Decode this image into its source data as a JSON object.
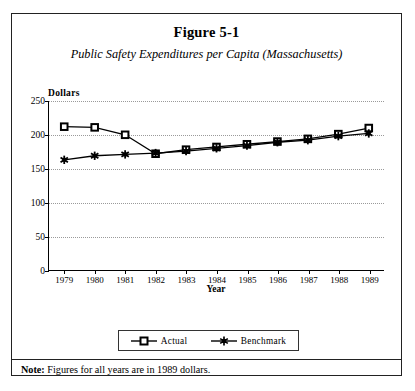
{
  "figure": {
    "title": "Figure 5-1",
    "subtitle": "Public Safety Expenditures per Capita (Massachusetts)",
    "note_label": "Note:",
    "note_text": " Figures for all years are in 1989 dollars."
  },
  "legend": {
    "items": [
      {
        "label": "Actual",
        "marker": "open-square",
        "color": "#000000"
      },
      {
        "label": "Benchmark",
        "marker": "filled-star",
        "color": "#000000"
      }
    ]
  },
  "chart_data": {
    "type": "line",
    "title": "Public Safety Expenditures per Capita (Massachusetts)",
    "xlabel": "Year",
    "ylabel": "Dollars",
    "categories": [
      "1979",
      "1980",
      "1981",
      "1982",
      "1983",
      "1984",
      "1985",
      "1986",
      "1987",
      "1988",
      "1989"
    ],
    "yticks": [
      0,
      50,
      100,
      150,
      200,
      250
    ],
    "ylim": [
      0,
      250
    ],
    "grid": true,
    "legend_position": "bottom-center",
    "series": [
      {
        "name": "Actual",
        "marker": "open-square",
        "values": [
          212,
          211,
          200,
          172,
          178,
          182,
          186,
          190,
          194,
          201,
          210
        ]
      },
      {
        "name": "Benchmark",
        "marker": "filled-star",
        "values": [
          163,
          169,
          171,
          173,
          176,
          180,
          184,
          189,
          192,
          198,
          202
        ]
      }
    ]
  }
}
